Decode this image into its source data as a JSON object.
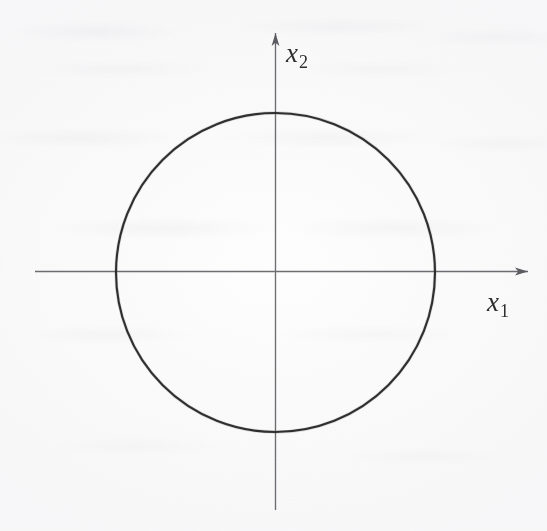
{
  "figure": {
    "kind": "cartesian-plot",
    "background_color": "#fdfdfd",
    "axis_color": "#6e6e72",
    "curve_color": "#2f2f2f",
    "label_color": "#2e2e2e"
  },
  "axes": {
    "horizontal": {
      "name": "x1-axis",
      "label_x": "x",
      "label_sub": "1",
      "arrow": "right",
      "start_px": 35,
      "end_px": 528,
      "y_px": 271
    },
    "vertical": {
      "name": "x2-axis",
      "label_x": "x",
      "label_sub": "2",
      "arrow": "up",
      "start_px": 510,
      "end_px": 33,
      "x_px": 275
    },
    "origin": {
      "x_px": 275,
      "y_px": 271
    }
  },
  "chart_data": {
    "type": "line",
    "title": "",
    "subtitle": "",
    "xlabel": "x1",
    "ylabel": "x2",
    "grid": false,
    "legend": null,
    "xlim": [
      -1.5,
      1.6
    ],
    "ylim": [
      -1.5,
      1.5
    ],
    "annotations": [],
    "series": [
      {
        "name": "unit-circle",
        "shape": "circle",
        "equation": "x1^2 + x2^2 = 1",
        "center": [
          0,
          0
        ],
        "radius": 1,
        "closed": true,
        "stroke_color": "#2f2f2f",
        "stroke_width_px": 2.1,
        "x": [
          1.0,
          0.924,
          0.707,
          0.383,
          0.0,
          -0.383,
          -0.707,
          -0.924,
          -1.0,
          -0.924,
          -0.707,
          -0.383,
          0.0,
          0.383,
          0.707,
          0.924,
          1.0
        ],
        "y": [
          0.0,
          0.383,
          0.707,
          0.924,
          1.0,
          0.924,
          0.707,
          0.383,
          0.0,
          -0.383,
          -0.707,
          -0.924,
          -1.0,
          -0.924,
          -0.707,
          -0.383,
          0.0
        ]
      }
    ],
    "pixel_geometry": {
      "circle_center_px": [
        275.5,
        272.5
      ],
      "circle_radius_px": 159.5
    }
  },
  "labels": {
    "x1": {
      "base": "x",
      "sub": "1"
    },
    "x2": {
      "base": "x",
      "sub": "2"
    }
  }
}
